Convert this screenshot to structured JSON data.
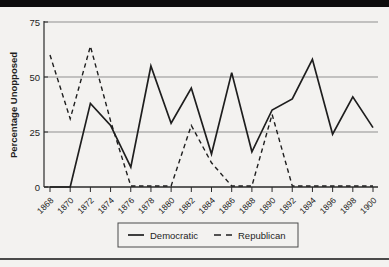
{
  "page": {
    "top_bar_color": "#0d0d0d",
    "background_color": "#f3f2f0",
    "bottom_rule_color": "#4a4a4a",
    "ink_color": "#1e1e1e",
    "grid_color": "#8f8f8f",
    "axis_color": "#2a2a2a"
  },
  "chart_data": {
    "type": "line",
    "title": "",
    "xlabel": "",
    "ylabel": "Percentage Unopposed",
    "ylim": [
      0,
      75
    ],
    "yticks": [
      0,
      25,
      50,
      75
    ],
    "grid": "horizontal gridlines at 25, 50, 75",
    "legend_position": "bottom-center-boxed",
    "x": [
      "1868",
      "1870",
      "1872",
      "1874",
      "1876",
      "1878",
      "1880",
      "1882",
      "1884",
      "1886",
      "1888",
      "1890",
      "1892",
      "1894",
      "1896",
      "1898",
      "1900"
    ],
    "series": [
      {
        "name": "Democratic",
        "style": "solid",
        "color": "#1e1e1e",
        "values": [
          0,
          0,
          38,
          28,
          9,
          55,
          29,
          45,
          15,
          52,
          16,
          35,
          40,
          58,
          24,
          41,
          27
        ]
      },
      {
        "name": "Republican",
        "style": "dashed",
        "color": "#1e1e1e",
        "values": [
          60,
          31,
          64,
          30,
          0,
          0,
          0,
          28,
          11,
          0,
          0,
          33,
          0,
          0,
          0,
          0,
          0
        ]
      }
    ]
  }
}
